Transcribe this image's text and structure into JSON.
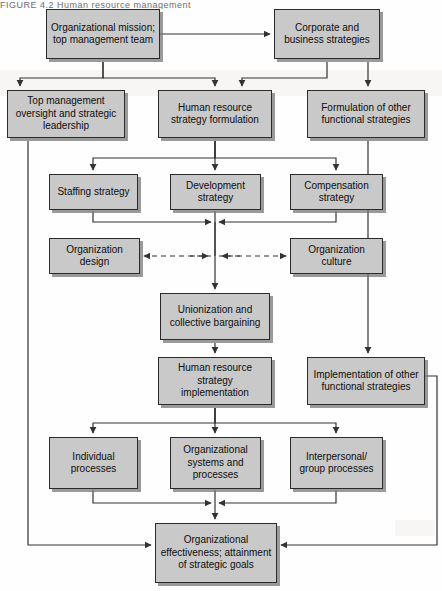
{
  "page": {
    "header_text": "FIGURE 4.2    Human resource management",
    "width": 442,
    "height": 591,
    "box_fill": "#c9c9c9",
    "box_border": "#2b2b2b",
    "line_color": "#333333",
    "background": "#fefefe"
  },
  "diagram": {
    "type": "flowchart",
    "nodes": [
      {
        "id": "organizational-mission",
        "label": "Organizational mission; top management team",
        "x": 46,
        "y": 9,
        "w": 114,
        "h": 50
      },
      {
        "id": "corporate-business-strategies",
        "label": "Corporate and business strategies",
        "x": 274,
        "y": 9,
        "w": 106,
        "h": 50
      },
      {
        "id": "top-management-oversight",
        "label": "Top management oversight and strategic leadership",
        "x": 7,
        "y": 90,
        "w": 118,
        "h": 48
      },
      {
        "id": "hr-strategy-formulation",
        "label": "Human resource strategy formulation",
        "x": 158,
        "y": 90,
        "w": 114,
        "h": 48
      },
      {
        "id": "formulation-other-strategies",
        "label": "Formulation of other functional strategies",
        "x": 307,
        "y": 90,
        "w": 118,
        "h": 48
      },
      {
        "id": "staffing-strategy",
        "label": "Staffing strategy",
        "x": 49,
        "y": 174,
        "w": 89,
        "h": 36
      },
      {
        "id": "development-strategy",
        "label": "Development strategy",
        "x": 170,
        "y": 174,
        "w": 91,
        "h": 36
      },
      {
        "id": "compensation-strategy",
        "label": "Compensation strategy",
        "x": 290,
        "y": 174,
        "w": 93,
        "h": 36
      },
      {
        "id": "organization-design",
        "label": "Organization design",
        "x": 49,
        "y": 238,
        "w": 91,
        "h": 36
      },
      {
        "id": "organization-culture",
        "label": "Organization culture",
        "x": 290,
        "y": 238,
        "w": 93,
        "h": 36
      },
      {
        "id": "unionization-collective-bargaining",
        "label": "Unionization and collective bargaining",
        "x": 160,
        "y": 293,
        "w": 110,
        "h": 47
      },
      {
        "id": "hr-strategy-implementation",
        "label": "Human resource strategy implementation",
        "x": 158,
        "y": 357,
        "w": 114,
        "h": 48
      },
      {
        "id": "implementation-other-strategies",
        "label": "Implementation of other functional strategies",
        "x": 307,
        "y": 357,
        "w": 118,
        "h": 48
      },
      {
        "id": "individual-processes",
        "label": "Individual processes",
        "x": 49,
        "y": 437,
        "w": 89,
        "h": 52
      },
      {
        "id": "organizational-systems-processes",
        "label": "Organizational systems and processes",
        "x": 170,
        "y": 437,
        "w": 91,
        "h": 52
      },
      {
        "id": "interpersonal-group-processes",
        "label": "Interpersonal/ group processes",
        "x": 290,
        "y": 437,
        "w": 93,
        "h": 52
      },
      {
        "id": "organizational-effectiveness",
        "label": "Organizational effectiveness; attainment of strategic goals",
        "x": 155,
        "y": 523,
        "w": 122,
        "h": 60
      }
    ],
    "edges": [
      {
        "from": "organizational-mission",
        "to": "corporate-business-strategies",
        "style": "solid"
      },
      {
        "from": "organizational-mission",
        "to": "hr-strategy-formulation",
        "style": "solid"
      },
      {
        "from": "corporate-business-strategies",
        "to": "hr-strategy-formulation",
        "style": "solid"
      },
      {
        "from": "corporate-business-strategies",
        "to": "formulation-other-strategies",
        "style": "solid"
      },
      {
        "from": "organizational-mission",
        "to": "top-management-oversight",
        "style": "solid"
      },
      {
        "from": "top-management-oversight",
        "to": "organizational-effectiveness",
        "style": "solid"
      },
      {
        "from": "hr-strategy-formulation",
        "to": "staffing-strategy",
        "style": "solid"
      },
      {
        "from": "hr-strategy-formulation",
        "to": "development-strategy",
        "style": "solid"
      },
      {
        "from": "hr-strategy-formulation",
        "to": "compensation-strategy",
        "style": "solid"
      },
      {
        "from": "staffing-strategy",
        "to": "unionization-collective-bargaining",
        "style": "solid"
      },
      {
        "from": "development-strategy",
        "to": "unionization-collective-bargaining",
        "style": "solid"
      },
      {
        "from": "compensation-strategy",
        "to": "unionization-collective-bargaining",
        "style": "solid"
      },
      {
        "from": "organization-design",
        "to": "center-line",
        "style": "dashed",
        "bidirectional": true
      },
      {
        "from": "organization-culture",
        "to": "center-line",
        "style": "dashed",
        "bidirectional": true
      },
      {
        "from": "unionization-collective-bargaining",
        "to": "hr-strategy-implementation",
        "style": "solid"
      },
      {
        "from": "formulation-other-strategies",
        "to": "implementation-other-strategies",
        "style": "solid"
      },
      {
        "from": "hr-strategy-implementation",
        "to": "individual-processes",
        "style": "solid"
      },
      {
        "from": "hr-strategy-implementation",
        "to": "organizational-systems-processes",
        "style": "solid"
      },
      {
        "from": "hr-strategy-implementation",
        "to": "interpersonal-group-processes",
        "style": "solid"
      },
      {
        "from": "individual-processes",
        "to": "organizational-effectiveness",
        "style": "solid"
      },
      {
        "from": "organizational-systems-processes",
        "to": "organizational-effectiveness",
        "style": "solid"
      },
      {
        "from": "interpersonal-group-processes",
        "to": "organizational-effectiveness",
        "style": "solid"
      },
      {
        "from": "implementation-other-strategies",
        "to": "organizational-effectiveness",
        "style": "solid"
      }
    ]
  }
}
